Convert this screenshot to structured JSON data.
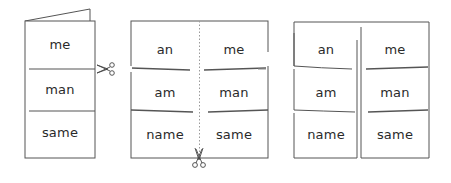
{
  "diagram": {
    "steps": [
      {
        "name": "folded-booklet",
        "words": [
          "me",
          "man",
          "same"
        ]
      },
      {
        "name": "cut-booklet",
        "left_column": [
          "an",
          "am",
          "name"
        ],
        "right_column": [
          "me",
          "man",
          "same"
        ]
      },
      {
        "name": "separated-cards",
        "left_column": [
          "an",
          "am",
          "name"
        ],
        "right_column": [
          "me",
          "man",
          "same"
        ]
      }
    ],
    "icons": [
      "scissors-icon-horizontal",
      "scissors-icon-vertical"
    ],
    "colors": {
      "line": "#555555",
      "text": "#2a2a2a",
      "dotted": "#9a9a9a"
    }
  }
}
